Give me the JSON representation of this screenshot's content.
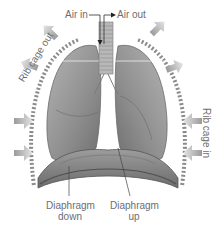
{
  "diagram": {
    "labels": {
      "air_in": "Air in",
      "air_out": "Air out",
      "rib_cage_out": "Rib cage out",
      "rib_cage_in": "Rib cage in",
      "diaphragm_down_line1": "Diaphragm",
      "diaphragm_down_line2": "down",
      "diaphragm_up_line1": "Diaphragm",
      "diaphragm_up_line2": "up"
    },
    "colors": {
      "background": "#ffffff",
      "text": "#6e6e6e",
      "lung_fill": "#9a9a9a",
      "lung_dark": "#7a7a7a",
      "rib_band": "#8c8c8c",
      "arrow": "#a8a8a8",
      "diaphragm": "#8a8a8a"
    }
  }
}
